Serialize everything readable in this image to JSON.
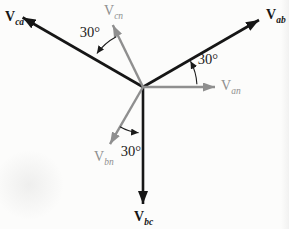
{
  "figure": {
    "name": "three-phase-voltage-phasor-diagram",
    "background": "#fcfcfb",
    "origin": {
      "x": 143,
      "y": 87
    },
    "annotation_color": "#1a1a1a",
    "groups": {
      "line_to_line": {
        "color": "#161616",
        "stroke_width": 2.6,
        "label_weight": "bold",
        "arrow_len": 13,
        "arrow_wid": 10
      },
      "line_to_neutral": {
        "color": "#8f8f8f",
        "stroke_width": 2.4,
        "label_weight": "normal",
        "arrow_len": 12,
        "arrow_wid": 9
      }
    },
    "vectors": [
      {
        "id": "Vab",
        "base": "V",
        "subscript": "ab",
        "group": "line_to_line",
        "angle_deg": 30,
        "length": 134,
        "label_x": 266,
        "label_y": 19
      },
      {
        "id": "Vca",
        "base": "V",
        "subscript": "ca",
        "group": "line_to_line",
        "angle_deg": 150,
        "length": 139,
        "label_x": 5,
        "label_y": 21
      },
      {
        "id": "Vbc",
        "base": "V",
        "subscript": "bc",
        "group": "line_to_line",
        "angle_deg": 270,
        "length": 117,
        "label_x": 134,
        "label_y": 221
      },
      {
        "id": "Van",
        "base": "V",
        "subscript": "an",
        "group": "line_to_neutral",
        "angle_deg": 0,
        "length": 72,
        "label_x": 221,
        "label_y": 90
      },
      {
        "id": "Vcn",
        "base": "V",
        "subscript": "cn",
        "group": "line_to_neutral",
        "angle_deg": 116,
        "length": 69,
        "label_x": 104,
        "label_y": 15
      },
      {
        "id": "Vbn",
        "base": "V",
        "subscript": "bn",
        "group": "line_to_neutral",
        "angle_deg": 240,
        "length": 66,
        "label_x": 94,
        "label_y": 161
      }
    ],
    "angle_annotations": [
      {
        "label": "30°",
        "between": [
          "Vcn",
          "Vca"
        ],
        "text_x": 90,
        "text_y": 37,
        "radius": 57,
        "from_deg": 118,
        "to_deg": 144
      },
      {
        "label": "30°",
        "between": [
          "Van",
          "Vab"
        ],
        "text_x": 208,
        "text_y": 64,
        "radius": 54,
        "from_deg": 3,
        "to_deg": 28.5
      },
      {
        "label": "30°",
        "between": [
          "Vbn",
          "Vbc"
        ],
        "text_x": 131,
        "text_y": 156,
        "radius": 46,
        "from_deg": -120,
        "to_deg": -95.5
      }
    ]
  }
}
